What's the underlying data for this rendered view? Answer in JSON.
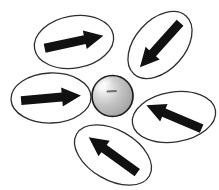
{
  "diagram": {
    "background_color": "#ffffff",
    "oval_stroke_color": "#2e2e2e",
    "oval_stroke_width": 1.3,
    "arrow_color": "#111111",
    "arrow": {
      "length": 60,
      "shaft_width": 9,
      "head_length": 19,
      "head_width": 19
    },
    "sphere": {
      "cx": 112.5,
      "cy": 96,
      "r": 20.5,
      "outline_color": "#1b1b1b",
      "outline_width": 1.7,
      "gradient_stops": [
        "#f8f8f8",
        "#e2e2e2",
        "#c3c3c3",
        "#aeaeae",
        "#9a9a9a"
      ],
      "gradient_offsets": [
        0,
        22,
        50,
        78,
        100
      ],
      "highlight": {
        "cx": 103,
        "cy": 85,
        "rx": 11,
        "ry": 6.5,
        "rotation": -38
      },
      "dash": {
        "x1": 107.5,
        "y1": 91.5,
        "x2": 116,
        "y2": 91,
        "color": "#6e6e6e",
        "width": 1.8
      }
    },
    "ovals": [
      {
        "id": "top-left",
        "cx": 74,
        "cy": 42,
        "rx": 40,
        "ry": 26,
        "rotation": -10,
        "arrow_rotation": -12,
        "arrow_direction": "right"
      },
      {
        "id": "top-right",
        "cx": 160,
        "cy": 45,
        "rx": 39,
        "ry": 25,
        "rotation": -48,
        "arrow_rotation": 132,
        "arrow_direction": "down-left"
      },
      {
        "id": "middle-left",
        "cx": 51,
        "cy": 98,
        "rx": 40,
        "ry": 25,
        "rotation": -2,
        "arrow_rotation": -5,
        "arrow_direction": "right"
      },
      {
        "id": "right",
        "cx": 174,
        "cy": 117,
        "rx": 42,
        "ry": 25,
        "rotation": -9,
        "arrow_rotation": 203,
        "arrow_direction": "up-left"
      },
      {
        "id": "bottom",
        "cx": 113,
        "cy": 155,
        "rx": 42,
        "ry": 25,
        "rotation": 30,
        "arrow_rotation": 216,
        "arrow_direction": "up-left"
      }
    ]
  }
}
